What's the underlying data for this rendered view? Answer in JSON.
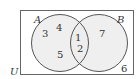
{
  "diagram": {
    "type": "venn",
    "universe_label": "U",
    "sets": [
      {
        "label": "A",
        "elements_only": [
          "3",
          "4",
          "5"
        ]
      },
      {
        "label": "B",
        "elements_only": [
          "7"
        ]
      }
    ],
    "intersection_elements": [
      "1",
      "2"
    ],
    "outside_elements": [
      "6"
    ],
    "colors": {
      "circle_fill": "#ececec",
      "stroke": "#555555",
      "text": "#333333"
    }
  }
}
